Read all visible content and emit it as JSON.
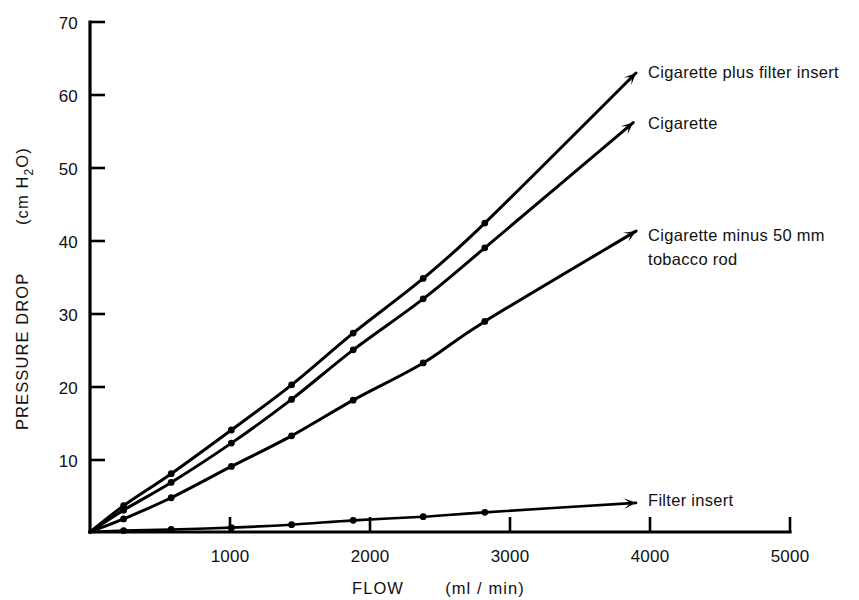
{
  "chart_data": {
    "type": "line",
    "title": "",
    "xlabel": "FLOW   (ml / min)",
    "ylabel": "PRESSURE DROP   (cm H₂O)",
    "ylabel_main": "PRESSURE DROP",
    "ylabel_unit": "(cm H₂O)",
    "xlabel_main": "FLOW",
    "xlabel_unit": "(ml / min)",
    "xlim": [
      0,
      5000
    ],
    "ylim": [
      0,
      70
    ],
    "xticks": [
      1000,
      2000,
      3000,
      4000,
      5000
    ],
    "xtick_labels": [
      "1000",
      "2000",
      "3000",
      "4000",
      "5000"
    ],
    "yticks": [
      10,
      20,
      30,
      40,
      50,
      60,
      70
    ],
    "ytick_labels": [
      "10",
      "20",
      "30",
      "40",
      "50",
      "60",
      "70"
    ],
    "grid": false,
    "legend_position": "right-inline-annotations",
    "line_color": "#000000",
    "marker_color": "#000000",
    "series": [
      {
        "name": "Cigarette plus filter insert",
        "label": "Cigarette plus filter insert",
        "label_lines": [
          "Cigarette plus filter insert"
        ],
        "x": [
          240,
          580,
          1010,
          1440,
          1880,
          2380,
          2820,
          3900
        ],
        "y": [
          3.6,
          8.0,
          14.0,
          20.2,
          27.3,
          34.8,
          42.4,
          63.0
        ]
      },
      {
        "name": "Cigarette",
        "label": "Cigarette",
        "label_lines": [
          "Cigarette"
        ],
        "x": [
          240,
          580,
          1010,
          1440,
          1880,
          2380,
          2820,
          3880
        ],
        "y": [
          3.0,
          6.8,
          12.2,
          18.2,
          25.0,
          32.0,
          39.0,
          56.2
        ]
      },
      {
        "name": "Cigarette minus 50 mm tobacco rod",
        "label": "Cigarette minus 50 mm tobacco rod",
        "label_lines": [
          "Cigarette minus 50 mm",
          "tobacco rod"
        ],
        "x": [
          240,
          580,
          1010,
          1440,
          1880,
          2380,
          2820,
          3900
        ],
        "y": [
          1.8,
          4.7,
          9.0,
          13.2,
          18.1,
          23.2,
          28.9,
          41.3
        ]
      },
      {
        "name": "Filter insert",
        "label": "Filter insert",
        "label_lines": [
          "Filter insert"
        ],
        "x": [
          240,
          580,
          1010,
          1440,
          1880,
          2380,
          2820,
          3900
        ],
        "y": [
          0.2,
          0.35,
          0.6,
          1.0,
          1.6,
          2.1,
          2.7,
          4.0
        ]
      }
    ]
  },
  "annotations": {
    "series_0_label": "Cigarette plus filter insert",
    "series_1_label": "Cigarette",
    "series_2_label_line1": "Cigarette minus 50 mm",
    "series_2_label_line2": "tobacco rod",
    "series_3_label": "Filter insert"
  },
  "axes": {
    "y_title_main": "PRESSURE DROP",
    "y_title_unit": "(cm H",
    "y_title_sub": "2",
    "y_title_tail": "O)",
    "x_title_main": "FLOW",
    "x_title_unit": "(ml / min)"
  }
}
